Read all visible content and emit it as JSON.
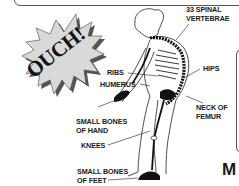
{
  "burst": {
    "text": "OUCH!"
  },
  "labels": {
    "spinal_line1": "33 SPINAL",
    "spinal_line2": "VERTEBRAE",
    "ribs": "RIBS",
    "humerus": "HUMERUS",
    "hips": "HIPS",
    "hand_line1": "SMALL BONES",
    "hand_line2": "OF HAND",
    "femur_line1": "NECK OF",
    "femur_line2": "FEMUR",
    "knees": "KNEES",
    "feet_line1": "SMALL BONES",
    "feet_line2": "OF FEET"
  },
  "cut_off_text": "M",
  "colors": {
    "ink": "#1a1a1a",
    "burst_fill": "#d9d9d9",
    "burst_shadow": "#555555",
    "background": "#ffffff"
  }
}
